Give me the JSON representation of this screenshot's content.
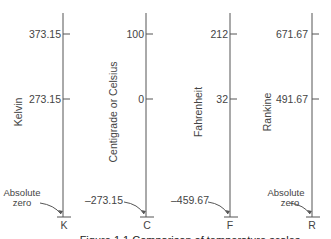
{
  "figure": {
    "caption": "Figure 1.1 Comparison of temperature scales",
    "scales": [
      {
        "name": "Kelvin",
        "symbol": "K",
        "upper": "373.15",
        "lower": "273.15",
        "bottom": "Absolute",
        "bottom2": "zero"
      },
      {
        "name": "Centigrade or Celsius",
        "symbol": "C",
        "upper": "100",
        "lower": "0",
        "bottom": "–273.15",
        "bottom2": ""
      },
      {
        "name": "Fahrenheit",
        "symbol": "F",
        "upper": "212",
        "lower": "32",
        "bottom": "–459.67",
        "bottom2": ""
      },
      {
        "name": "Rankine",
        "symbol": "R",
        "upper": "671.67",
        "lower": "491.67",
        "bottom": "Absolute",
        "bottom2": "zero"
      }
    ]
  }
}
